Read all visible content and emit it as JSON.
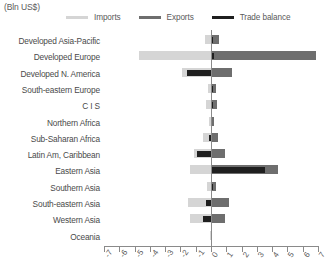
{
  "units_label": "(Bln US$)",
  "legend": {
    "position": "top",
    "items": [
      {
        "label": "Imports",
        "color": "#d5d5d5",
        "name": "imports"
      },
      {
        "label": "Exports",
        "color": "#6e6e6e",
        "name": "exports"
      },
      {
        "label": "Trade balance",
        "color": "#1f1f1f",
        "name": "trade-balance"
      }
    ]
  },
  "axis": {
    "ticks": [
      "-7",
      "-6",
      "-5",
      "-4",
      "-3",
      "-2",
      "-1",
      "0",
      "1",
      "2",
      "3",
      "4",
      "5",
      "6",
      "7"
    ],
    "min": -7,
    "max": 7
  },
  "chart_data": {
    "type": "bar",
    "orientation": "horizontal",
    "title": "",
    "subtitle": "",
    "xlabel": "(Bln US$)",
    "ylabel": "",
    "xlim": [
      -7,
      7
    ],
    "grid": false,
    "legend_position": "top",
    "categories": [
      "Developed Asia-Pacific",
      "Developed Europe",
      "Developed N. America",
      "South-eastern Europe",
      "C I S",
      "Northern Africa",
      "Sub-Saharan Africa",
      "Latin Am, Caribbean",
      "Eastern Asia",
      "Southern Asia",
      "South-eastern Asia",
      "Western Asia",
      "Oceania"
    ],
    "series": [
      {
        "name": "Imports",
        "color": "#d5d5d5",
        "values": [
          -0.4,
          -4.7,
          -1.9,
          -0.2,
          -0.35,
          -0.15,
          -0.55,
          -1.1,
          -1.4,
          -0.25,
          -1.5,
          -1.4,
          -0.05
        ]
      },
      {
        "name": "Exports",
        "color": "#6e6e6e",
        "values": [
          0.5,
          6.9,
          1.4,
          0.35,
          0.4,
          0.2,
          0.45,
          0.9,
          4.4,
          0.35,
          1.2,
          0.9,
          0.05
        ]
      },
      {
        "name": "Trade balance",
        "color": "#1f1f1f",
        "values": [
          0.15,
          0.2,
          -1.6,
          0.1,
          0.1,
          0.05,
          -0.1,
          -0.9,
          3.5,
          0.1,
          -0.3,
          -0.5,
          0.0
        ]
      }
    ]
  }
}
